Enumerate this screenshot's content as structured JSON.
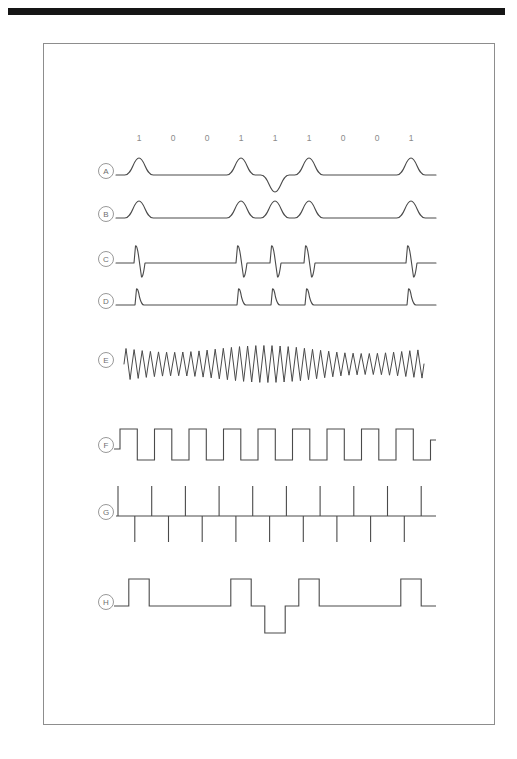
{
  "page": {
    "frame": {
      "x": 43,
      "y": 43,
      "width": 452,
      "height": 682
    },
    "top_bar_color": "#151515",
    "frame_border_color": "#8d8d8d",
    "trace_color": "#4a4a4a",
    "label_color": "#6f6f6f",
    "bit_label_color": "#8a8a8a"
  },
  "chart_data": {
    "type": "line",
    "title": "",
    "xlabel": "",
    "ylabel": "",
    "grid": false,
    "legend": "none",
    "bit_sequence": [
      "1",
      "0",
      "0",
      "1",
      "1",
      "1",
      "0",
      "0",
      "1"
    ],
    "bit_count": 9,
    "bit_slot_width_px": 34,
    "x_origin_px": 78,
    "trace_right_end_px": 392,
    "series": [
      {
        "id": "A",
        "label": "A",
        "name": "bipolar-ami-pulse-train",
        "baseline_y": 131,
        "waveform": "gaussian-pulses",
        "pulse_amplitude": 17,
        "pulses": [
          {
            "bit_index": 0,
            "polarity": 1
          },
          {
            "bit_index": 3,
            "polarity": 1
          },
          {
            "bit_index": 4,
            "polarity": -1
          },
          {
            "bit_index": 5,
            "polarity": 1
          },
          {
            "bit_index": 8,
            "polarity": 1
          }
        ]
      },
      {
        "id": "B",
        "label": "B",
        "name": "rectified-pulse-train",
        "baseline_y": 174,
        "waveform": "gaussian-pulses",
        "pulse_amplitude": 17,
        "pulses": [
          {
            "bit_index": 0,
            "polarity": 1
          },
          {
            "bit_index": 3,
            "polarity": 1
          },
          {
            "bit_index": 4,
            "polarity": 1
          },
          {
            "bit_index": 5,
            "polarity": 1
          },
          {
            "bit_index": 8,
            "polarity": 1
          }
        ]
      },
      {
        "id": "C",
        "label": "C",
        "name": "differentiated-bipolar-spikes",
        "baseline_y": 219,
        "waveform": "bipolar-spikes",
        "spike_up": 17,
        "spike_down": 14,
        "pulses": [
          {
            "bit_index": 0
          },
          {
            "bit_index": 3
          },
          {
            "bit_index": 4
          },
          {
            "bit_index": 5
          },
          {
            "bit_index": 8
          }
        ]
      },
      {
        "id": "D",
        "label": "D",
        "name": "unipolar-clipped-spikes",
        "baseline_y": 261,
        "waveform": "unipolar-spikes",
        "spike_up": 16,
        "pulses": [
          {
            "bit_index": 0
          },
          {
            "bit_index": 3
          },
          {
            "bit_index": 4
          },
          {
            "bit_index": 5
          },
          {
            "bit_index": 8
          }
        ]
      },
      {
        "id": "E",
        "label": "E",
        "name": "ringing-oscillation",
        "baseline_y": 320,
        "waveform": "damped-oscillation",
        "cycles": 37,
        "amplitude_base": 20,
        "envelope_note": "amplitude modulated, larger near pulse positions"
      },
      {
        "id": "F",
        "label": "F",
        "name": "recovered-clock-square-wave",
        "baseline_y": 405,
        "waveform": "square-wave",
        "amplitude": 20,
        "period_px": 34.5,
        "duty_cycle": 0.5,
        "cycles": 9
      },
      {
        "id": "G",
        "label": "G",
        "name": "differentiated-clock-spikes",
        "baseline_y": 472,
        "waveform": "alternating-ticks",
        "tick_up": 30,
        "tick_down": 26,
        "tick_count": 19
      },
      {
        "id": "H",
        "label": "H",
        "name": "regenerated-bipolar-rz-output",
        "baseline_y": 562,
        "waveform": "bipolar-return-to-zero",
        "amplitude": 27,
        "pulses": [
          {
            "bit_index": 0,
            "polarity": 1
          },
          {
            "bit_index": 3,
            "polarity": 1
          },
          {
            "bit_index": 4,
            "polarity": -1
          },
          {
            "bit_index": 5,
            "polarity": 1
          },
          {
            "bit_index": 8,
            "polarity": 1
          }
        ]
      }
    ]
  }
}
